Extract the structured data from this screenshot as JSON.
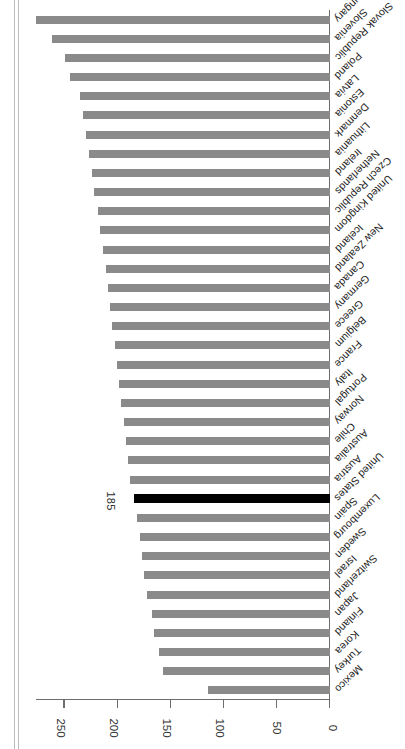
{
  "chart_data": {
    "type": "bar",
    "orientation": "horizontal",
    "title": "",
    "subtitle": "",
    "xlabel": "",
    "ylabel": "",
    "xlim": [
      0,
      277
    ],
    "grid": false,
    "legend": false,
    "highlight_category": "United States",
    "highlight_value_label": "185",
    "highlight_color": "#000000",
    "bar_color": "#8a8a8a",
    "axis_color": "#6e6e6e",
    "tick_labels": [
      "0",
      "50",
      "100",
      "150",
      "200",
      "250"
    ],
    "tick_values": [
      0,
      50,
      100,
      150,
      200,
      250
    ],
    "categories": [
      "Mexico",
      "Turkey",
      "Korea",
      "Finland",
      "Japan",
      "Switzerland",
      "Israel",
      "Sweden",
      "Luxembourg",
      "Spain",
      "United States",
      "Austria",
      "Australia",
      "Chile",
      "Norway",
      "Portugal",
      "Italy",
      "France",
      "Belgium",
      "Greece",
      "Germany",
      "Canada",
      "New Zealand",
      "Iceland",
      "United Kingdom",
      "Czech Republic",
      "Netherlands",
      "Ireland",
      "Lithuania",
      "Denmark",
      "Estonia",
      "Latvia",
      "Poland",
      "Slovak Republic",
      "Slovenia",
      "Hungary"
    ],
    "values": [
      115,
      157,
      161,
      166,
      168,
      172,
      175,
      177,
      179,
      182,
      185,
      188,
      190,
      192,
      194,
      197,
      199,
      201,
      203,
      205,
      207,
      209,
      211,
      214,
      217,
      219,
      222,
      224,
      227,
      230,
      233,
      236,
      245,
      250,
      262,
      277
    ]
  }
}
